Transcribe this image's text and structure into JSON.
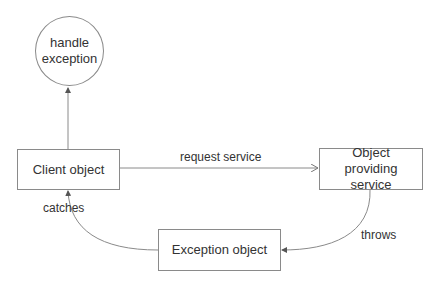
{
  "diagram": {
    "nodes": {
      "handle_exception": {
        "label": "handle exception",
        "shape": "circle"
      },
      "client_object": {
        "label": "Client object",
        "shape": "rectangle"
      },
      "object_providing_service": {
        "label": "Object providing service",
        "shape": "rectangle"
      },
      "exception_object": {
        "label": "Exception object",
        "shape": "rectangle"
      }
    },
    "edges": [
      {
        "from": "client_object",
        "to": "handle_exception",
        "label": ""
      },
      {
        "from": "client_object",
        "to": "object_providing_service",
        "label": "request service"
      },
      {
        "from": "object_providing_service",
        "to": "exception_object",
        "label": "throws"
      },
      {
        "from": "exception_object",
        "to": "client_object",
        "label": "catches"
      }
    ],
    "colors": {
      "stroke": "#8a8a8a",
      "text": "#333333",
      "background": "#ffffff"
    }
  }
}
